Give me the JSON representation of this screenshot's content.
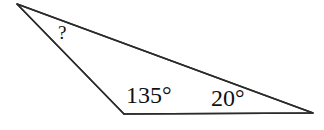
{
  "figure": {
    "kind": "triangle-angle-diagram",
    "background_color": "#FFFFFF",
    "stroke_color": "#2B2B2B",
    "stroke_width": 1.6,
    "text_color": "#111111",
    "width": 324,
    "height": 130,
    "vertices": [
      {
        "name": "apex-left",
        "x": 17,
        "y": 4
      },
      {
        "name": "bottom-left",
        "x": 124,
        "y": 114
      },
      {
        "name": "right",
        "x": 313,
        "y": 113
      }
    ],
    "edges": [
      {
        "name": "edge-apex-to-right",
        "from": "apex-left",
        "to": "right"
      },
      {
        "name": "edge-apex-to-bottom-left",
        "from": "apex-left",
        "to": "bottom-left"
      },
      {
        "name": "edge-bottom-left-to-right",
        "from": "bottom-left",
        "to": "right"
      }
    ]
  },
  "labels": {
    "unknown_angle": "?",
    "bottom_left_angle": "135°",
    "right_angle": "20°"
  },
  "chart_data": {
    "type": "diagram",
    "title": "",
    "shape": "triangle",
    "angles": [
      {
        "vertex": "apex-left",
        "label": "?",
        "value": null,
        "unit": "degrees"
      },
      {
        "vertex": "bottom-left",
        "label": "135°",
        "value": 135,
        "unit": "degrees"
      },
      {
        "vertex": "right",
        "label": "20°",
        "value": 20,
        "unit": "degrees"
      }
    ],
    "points": [
      {
        "name": "apex-left",
        "x": 17,
        "y": 4
      },
      {
        "name": "bottom-left",
        "x": 124,
        "y": 114
      },
      {
        "name": "right",
        "x": 313,
        "y": 113
      }
    ]
  }
}
